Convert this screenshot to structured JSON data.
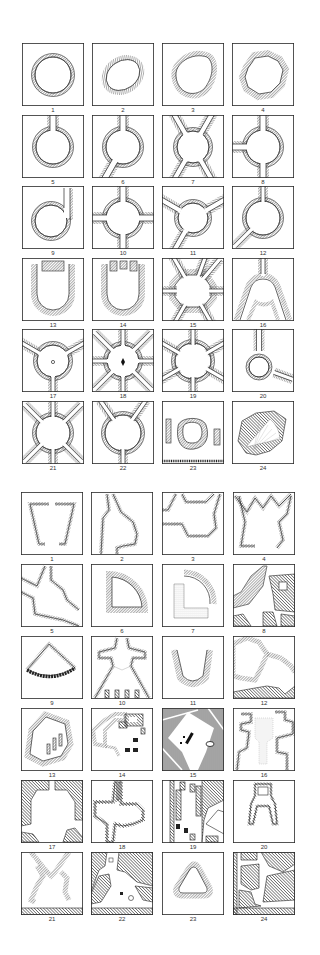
{
  "figure": {
    "colors": {
      "ink": "#2a2a2a",
      "hatch": "#555555",
      "background": "#ffffff"
    }
  },
  "grids": [
    {
      "name": "circular-places",
      "top": 43,
      "row_step": 71.5,
      "cols_x": [
        22,
        92,
        162,
        232
      ],
      "items": [
        {
          "n": "1",
          "type": "circle"
        },
        {
          "n": "2",
          "type": "ellipse"
        },
        {
          "n": "3",
          "type": "egg"
        },
        {
          "n": "4",
          "type": "irregular-ring"
        },
        {
          "n": "5",
          "type": "circle-1-street"
        },
        {
          "n": "6",
          "type": "circle-2-streets"
        },
        {
          "n": "7",
          "type": "circle-4-diagonal"
        },
        {
          "n": "8",
          "type": "circle-3-streets"
        },
        {
          "n": "9",
          "type": "circle-tangent"
        },
        {
          "n": "10",
          "type": "circle-cross"
        },
        {
          "n": "11",
          "type": "circle-3-radial"
        },
        {
          "n": "12",
          "type": "circle-2-radial"
        },
        {
          "n": "13",
          "type": "u-shape"
        },
        {
          "n": "14",
          "type": "u-shape-3"
        },
        {
          "n": "15",
          "type": "octagon-radial"
        },
        {
          "n": "16",
          "type": "arched-fork"
        },
        {
          "n": "17",
          "type": "circle-3-radial-monument"
        },
        {
          "n": "18",
          "type": "circle-8-radial-monument"
        },
        {
          "n": "19",
          "type": "circle-8-radial"
        },
        {
          "n": "20",
          "type": "small-circle-3"
        },
        {
          "n": "21",
          "type": "circle-6-radial"
        },
        {
          "n": "22",
          "type": "circle-3-top"
        },
        {
          "n": "23",
          "type": "oval-island"
        },
        {
          "n": "24",
          "type": "fan-theatre"
        }
      ]
    },
    {
      "name": "irregular-places",
      "top": 492,
      "row_step": 72,
      "cols_x": [
        21,
        91,
        162,
        233
      ],
      "items": [
        {
          "n": "1",
          "type": "trapezoid"
        },
        {
          "n": "2",
          "type": "bulge"
        },
        {
          "n": "3",
          "type": "hexagonal-funnel"
        },
        {
          "n": "4",
          "type": "w-funnel"
        },
        {
          "n": "5",
          "type": "stepped-diagonal"
        },
        {
          "n": "6",
          "type": "quarter-circle"
        },
        {
          "n": "7",
          "type": "quarter-arc-L"
        },
        {
          "n": "8",
          "type": "dense-block"
        },
        {
          "n": "9",
          "type": "fan"
        },
        {
          "n": "10",
          "type": "cross-church"
        },
        {
          "n": "11",
          "type": "horseshoe"
        },
        {
          "n": "12",
          "type": "polygon-block"
        },
        {
          "n": "13",
          "type": "hexagon-3-piers"
        },
        {
          "n": "14",
          "type": "block-cluster"
        },
        {
          "n": "15",
          "type": "hatched-square-open"
        },
        {
          "n": "16",
          "type": "church-plan"
        },
        {
          "n": "17",
          "type": "octagon-blocks"
        },
        {
          "n": "18",
          "type": "cross-plan"
        },
        {
          "n": "19",
          "type": "strip-blocks"
        },
        {
          "n": "20",
          "type": "tower-gate"
        },
        {
          "n": "21",
          "type": "x-crossing"
        },
        {
          "n": "22",
          "type": "triangle-place"
        },
        {
          "n": "23",
          "type": "rounded-triangle"
        },
        {
          "n": "24",
          "type": "dense-blocks-2"
        }
      ]
    }
  ]
}
